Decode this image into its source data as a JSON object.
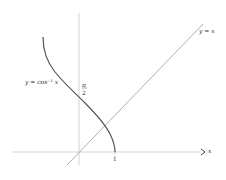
{
  "figure": {
    "curve_label": "y = cos⁻¹ x",
    "line_label": "y = x",
    "x_axis_label": "x",
    "x_tick_label": "1",
    "y_tick_numerator": "π",
    "y_tick_denominator": "2",
    "colors": {
      "axis": "#c8c8c8",
      "curve": "#555555",
      "line": "#9a9a9a",
      "text": "#333333"
    }
  }
}
